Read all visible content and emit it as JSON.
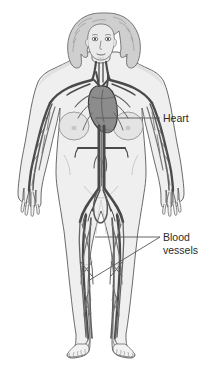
{
  "figure": {
    "kind": "anatomical-illustration",
    "background_color": "#ffffff"
  },
  "labels": [
    {
      "id": "heart",
      "text": "Heart",
      "lines": [
        "Heart"
      ],
      "text_x": 163,
      "text_y": 122,
      "leader": {
        "type": "straight",
        "from_x": 96,
        "from_y": 118,
        "to_x": 160,
        "to_y": 118
      }
    },
    {
      "id": "blood-vessels",
      "text": "Blood vessels",
      "lines": [
        "Blood",
        "vessels"
      ],
      "text_x": 163,
      "text_y": 241,
      "line_height": 13,
      "leader": {
        "type": "forked",
        "hub_x": 160,
        "hub_y": 237,
        "branches": [
          {
            "to_x": 95,
            "to_y": 237
          },
          {
            "to_x": 88,
            "to_y": 281
          }
        ]
      }
    }
  ],
  "colors": {
    "background": "#ffffff",
    "body_fill": "#efefef",
    "body_outline": "#5a5a5a",
    "skin_shade": "#dcdcdc",
    "hair_fill": "#cfcfcf",
    "hair_outline": "#6b6b6b",
    "heart_fill": "#8c8c8c",
    "heart_outline": "#3d3d3d",
    "vessel_dark": "#4a4a4a",
    "vessel_mid": "#666666",
    "vessel_light": "#7d7d7d",
    "leader_line": "#555555",
    "label_text": "#2b2b2b"
  },
  "typography": {
    "label_font_size_px": 10.5
  }
}
